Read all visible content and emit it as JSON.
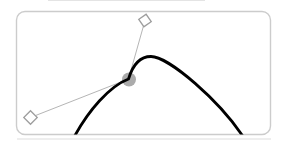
{
  "widget": {
    "type": "bezier-curve-editor",
    "canvas": {
      "width": 282,
      "height": 146,
      "background": "#ffffff"
    },
    "panel": {
      "x": 16.5,
      "y": 11.5,
      "width": 254,
      "height": 123,
      "corner_radius": 8.5,
      "fill": "#ffffff",
      "border_color": "#cccccc",
      "border_width": 1.4
    },
    "curve": {
      "path": "M 72 141 C 88 110 110 86 128.5 79 C 133 64 141 56.5 151 56.5 C 168 56.5 220 100 246 141",
      "color": "#000000",
      "width": 2.8
    },
    "keyframe": {
      "cx": 129,
      "cy": 79.5,
      "r": 7,
      "color": "#ababab"
    },
    "handle_lines": {
      "color": "#b5b5b5",
      "width": 1,
      "out": {
        "x1": 128.5,
        "y1": 79,
        "x2": 145,
        "y2": 20.5
      },
      "in": {
        "x1": 128.5,
        "y1": 79,
        "x2": 30.5,
        "y2": 117.5
      }
    },
    "handle_diamonds": {
      "fill": "#ffffff",
      "stroke": "#9e9e9e",
      "stroke_width": 1.3,
      "out": {
        "transform": "translate(145,20.5) rotate(55)",
        "size": 9,
        "offset": -4.5
      },
      "in": {
        "transform": "translate(30.5,117.5) rotate(45)",
        "size": 9.5,
        "offset": -4.75
      }
    },
    "artifact_lines": {
      "top": {
        "x1": 48,
        "y1": 0.5,
        "x2": 205,
        "y2": 0.5,
        "color": "#e4e4e4"
      },
      "bottom": {
        "x1": 17,
        "y1": 139,
        "x2": 271,
        "y2": 139,
        "color": "#dddddd"
      }
    }
  }
}
